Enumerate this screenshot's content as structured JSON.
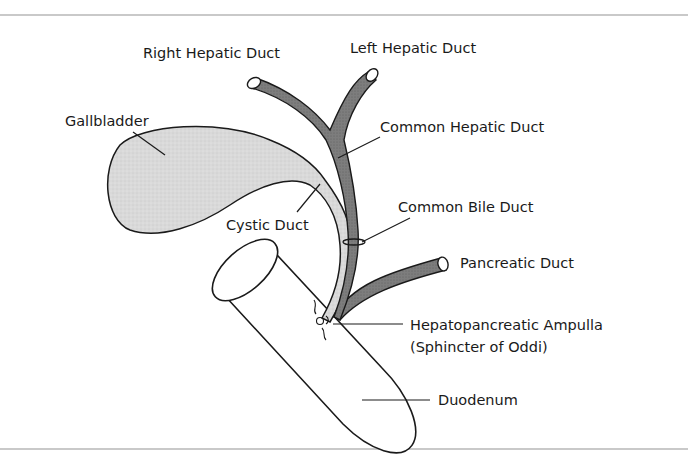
{
  "diagram": {
    "type": "anatomical",
    "labels": {
      "right_hepatic_duct": "Right Hepatic Duct",
      "left_hepatic_duct": "Left Hepatic Duct",
      "gallbladder": "Gallbladder",
      "common_hepatic_duct": "Common Hepatic Duct",
      "cystic_duct": "Cystic Duct",
      "common_bile_duct": "Common Bile Duct",
      "pancreatic_duct": "Pancreatic Duct",
      "ampulla_line1": "Hepatopancreatic Ampulla",
      "ampulla_line2": "(Sphincter of Oddi)",
      "duodenum": "Duodenum"
    },
    "colors": {
      "outline": "#1a1a1a",
      "dark_duct": "#7a7a7a",
      "light_duct": "#e2e2e2",
      "gallbladder_fill": "#dcdcdc",
      "border_rule": "#c9c9c9"
    }
  }
}
